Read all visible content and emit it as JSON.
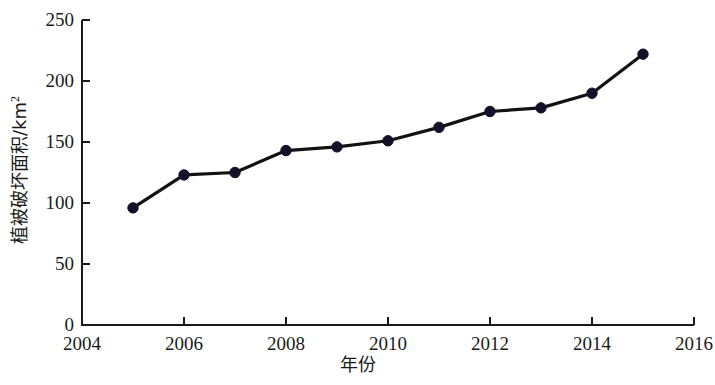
{
  "chart_data": {
    "type": "line",
    "title": "",
    "subtitle": "",
    "xlabel": "年份",
    "ylabel": "植被破坏面积/km",
    "ylabel_superscript": "2",
    "ylabel_full": "植被破坏面积/km²",
    "x": [
      2005,
      2006,
      2007,
      2008,
      2009,
      2010,
      2011,
      2012,
      2013,
      2014,
      2015
    ],
    "values": [
      96,
      123,
      125,
      143,
      146,
      151,
      162,
      175,
      178,
      190,
      222
    ],
    "series": [
      {
        "name": "植被破坏面积",
        "values": [
          96,
          123,
          125,
          143,
          146,
          151,
          162,
          175,
          178,
          190,
          222
        ]
      }
    ],
    "xlim": [
      2004,
      2016
    ],
    "ylim": [
      0,
      250
    ],
    "xticks": [
      2004,
      2006,
      2008,
      2010,
      2012,
      2014,
      2016
    ],
    "xtick_labels": [
      "2004",
      "2006",
      "2008",
      "2010",
      "2012",
      "2014",
      "2016"
    ],
    "yticks": [
      0,
      50,
      100,
      150,
      200,
      250
    ],
    "ytick_labels": [
      "0",
      "50",
      "100",
      "150",
      "200",
      "250"
    ],
    "grid": false,
    "legend": false,
    "legend_position": "none",
    "line_color": "#121212",
    "marker_color": "#11112a",
    "marker_shape": "circle",
    "axis_color": "#1a1a1a",
    "background_color": "#ffffff"
  }
}
